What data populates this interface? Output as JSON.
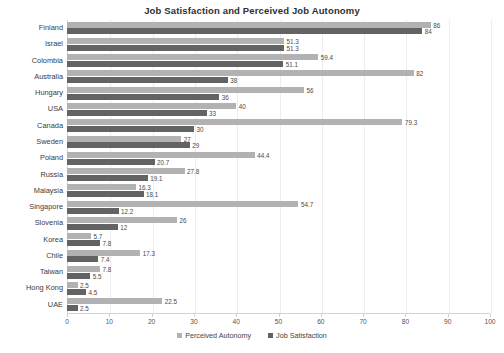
{
  "chart_data": {
    "type": "bar",
    "orientation": "horizontal",
    "title": "Job Satisfaction and Perceived Job Autonomy",
    "xlabel": "",
    "ylabel": "",
    "xlim": [
      0,
      100
    ],
    "xticks": [
      0,
      10,
      20,
      30,
      40,
      50,
      60,
      70,
      80,
      90,
      100
    ],
    "grid": true,
    "legend_position": "bottom",
    "categories": [
      "Finland",
      "Israel",
      "Colombia",
      "Australia",
      "Hungary",
      "USA",
      "Canada",
      "Sweden",
      "Poland",
      "Russia",
      "Malaysia",
      "Singapore",
      "Slovenia",
      "Korea",
      "Chile",
      "Taiwan",
      "Hong Kong",
      "UAE"
    ],
    "series": [
      {
        "name": "Perceived Autonomy",
        "color": "#b2b2b2",
        "values": [
          86,
          51.3,
          59.4,
          82,
          56,
          40,
          79.3,
          27,
          44.4,
          27.8,
          16.3,
          54.7,
          26,
          5.7,
          17.3,
          7.8,
          2.5,
          22.5
        ],
        "labels": [
          "86",
          "51.3",
          "59.4",
          "82",
          "56",
          "40",
          "79.3",
          "27",
          "44.4",
          "27.8",
          "16.3",
          "54.7",
          "26",
          "5.7",
          "17.3",
          "7.8",
          "2.5",
          "22.5"
        ]
      },
      {
        "name": "Job Satisfaction",
        "color": "#636363",
        "values": [
          84,
          51.3,
          51.1,
          38,
          36,
          33,
          30,
          29,
          20.7,
          19.1,
          18.1,
          12.2,
          12,
          7.8,
          7.4,
          5.5,
          4.5,
          2.5
        ],
        "labels": [
          "84",
          "51.3",
          "51.1",
          "38",
          "36",
          "33",
          "30",
          "29",
          "20.7",
          "19.1",
          "18.1",
          "12.2",
          "12",
          "7.8",
          "7.4",
          "5.5",
          "4.5",
          "2.5"
        ]
      }
    ]
  },
  "colors": {
    "autonomy": "#b2b2b2",
    "satisfaction": "#636363",
    "axis": "#d4d4d4",
    "gridline": "#ededed",
    "title_text": "#2f2f2f",
    "label_text": "#3a3a3a"
  }
}
